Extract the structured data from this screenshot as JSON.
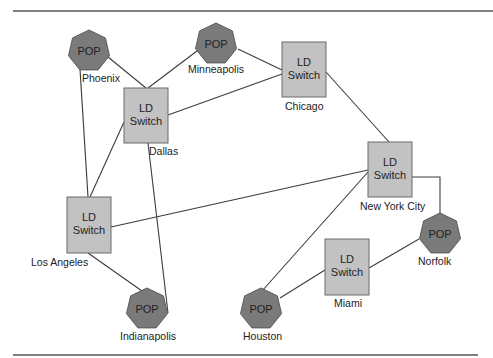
{
  "diagram": {
    "title": "",
    "colors": {
      "switch_fill": "#c2c2c2",
      "pop_fill": "#7a7a7a",
      "line": "#3c3c3c",
      "rule": "#555555"
    },
    "nodes": [
      {
        "id": "phoenix",
        "type": "POP",
        "label": "POP",
        "city": "Phoenix",
        "cx": 89,
        "cy": 51
      },
      {
        "id": "minneapolis",
        "type": "POP",
        "label": "POP",
        "city": "Minneapolis",
        "cx": 216,
        "cy": 44
      },
      {
        "id": "dallas",
        "type": "LD Switch",
        "label_line1": "LD",
        "label_line2": "Switch",
        "city": "Dallas",
        "x": 124,
        "y": 88,
        "w": 44,
        "h": 55
      },
      {
        "id": "chicago",
        "type": "LD Switch",
        "label_line1": "LD",
        "label_line2": "Switch",
        "city": "Chicago",
        "x": 282,
        "y": 42,
        "w": 44,
        "h": 55
      },
      {
        "id": "new_york_city",
        "type": "LD Switch",
        "label_line1": "LD",
        "label_line2": "Switch",
        "city": "New York City",
        "x": 368,
        "y": 142,
        "w": 44,
        "h": 55
      },
      {
        "id": "los_angeles",
        "type": "LD Switch",
        "label_line1": "LD",
        "label_line2": "Switch",
        "city": "Los Angeles",
        "x": 67,
        "y": 197,
        "w": 44,
        "h": 56
      },
      {
        "id": "norfolk",
        "type": "POP",
        "label": "POP",
        "city": "Norfolk",
        "cx": 440,
        "cy": 234
      },
      {
        "id": "miami",
        "type": "LD Switch",
        "label_line1": "LD",
        "label_line2": "Switch",
        "city": "Miami",
        "x": 325,
        "y": 239,
        "w": 44,
        "h": 56
      },
      {
        "id": "indianapolis",
        "type": "POP",
        "label": "POP",
        "city": "Indianapolis",
        "cx": 147,
        "cy": 309
      },
      {
        "id": "houston",
        "type": "POP",
        "label": "POP",
        "city": "Houston",
        "cx": 261,
        "cy": 309
      }
    ],
    "edges": [
      {
        "from": "Phoenix",
        "to": "Dallas"
      },
      {
        "from": "Phoenix",
        "to": "Los Angeles"
      },
      {
        "from": "Minneapolis",
        "to": "Dallas"
      },
      {
        "from": "Minneapolis",
        "to": "Chicago"
      },
      {
        "from": "Dallas",
        "to": "Chicago"
      },
      {
        "from": "Dallas",
        "to": "Los Angeles"
      },
      {
        "from": "Dallas",
        "to": "Indianapolis"
      },
      {
        "from": "Chicago",
        "to": "New York City"
      },
      {
        "from": "Los Angeles",
        "to": "New York City"
      },
      {
        "from": "Los Angeles",
        "to": "Indianapolis"
      },
      {
        "from": "New York City",
        "to": "Norfolk"
      },
      {
        "from": "New York City",
        "to": "Houston"
      },
      {
        "from": "Norfolk",
        "to": "Miami"
      },
      {
        "from": "Miami",
        "to": "Houston"
      }
    ]
  }
}
